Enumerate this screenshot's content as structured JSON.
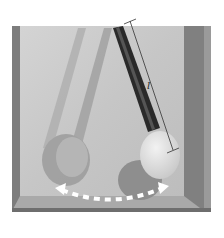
{
  "diagram": {
    "length_label": "l",
    "swing_arrow": "dashed double-headed arc",
    "colors": {
      "background": "#ffffff",
      "box_frame": "#8a8a8a",
      "box_inner": "#c9c9c9",
      "rod_active": "#2a2a2a",
      "rod_ghost": "#a8a8a8",
      "bob_active": "#e2e2e2",
      "bob_ghost": "#9c9c9c",
      "arrow": "#ffffff"
    }
  }
}
